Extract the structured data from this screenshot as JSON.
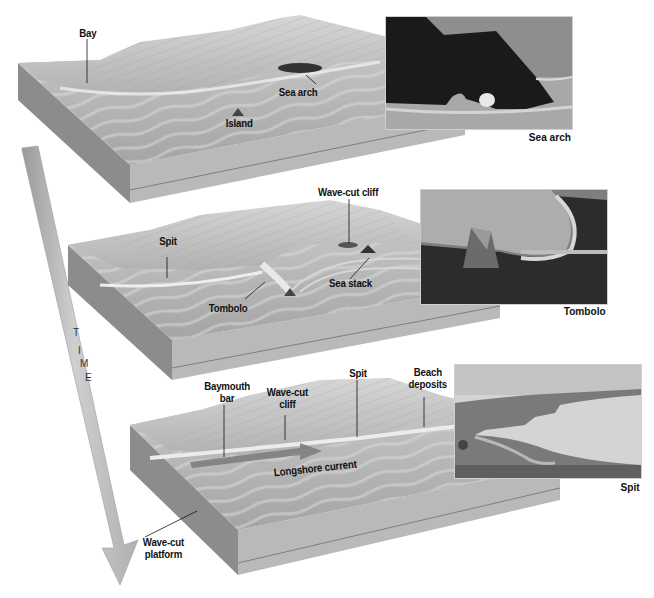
{
  "figure": {
    "type": "coastal-landform-evolution-diagram",
    "time_axis": {
      "label": "TIME",
      "letters": [
        "T",
        "I",
        "M",
        "E"
      ],
      "direction": "down"
    },
    "stages": [
      {
        "id": "stage-1",
        "labels": {
          "bay": "Bay",
          "sea_arch": "Sea arch",
          "island": "Island"
        },
        "photo": {
          "caption": "Sea arch",
          "subject": "sea-arch-photo"
        }
      },
      {
        "id": "stage-2",
        "labels": {
          "wave_cut_cliff": "Wave-cut cliff",
          "spit": "Spit",
          "sea_stack": "Sea stack",
          "tombolo": "Tombolo"
        },
        "photo": {
          "caption": "Tombolo",
          "subject": "tombolo-photo"
        }
      },
      {
        "id": "stage-3",
        "labels": {
          "baymouth_bar_1": "Baymouth",
          "baymouth_bar_2": "bar",
          "wave_cut_cliff_1": "Wave-cut",
          "wave_cut_cliff_2": "cliff",
          "spit": "Spit",
          "beach_deposits_1": "Beach",
          "beach_deposits_2": "deposits",
          "longshore_current": "Longshore current",
          "wave_cut_platform_1": "Wave-cut",
          "wave_cut_platform_2": "platform"
        },
        "photo": {
          "caption": "Spit",
          "subject": "spit-photo"
        }
      }
    ]
  },
  "colors": {
    "background": "#ffffff",
    "block_top": "#a9a9a9",
    "block_side": "#8a8a8a",
    "block_front": "#b8b8b8",
    "land": "#bdbdbd",
    "label_text": "#111111",
    "arrow": "#c4c4c4"
  }
}
